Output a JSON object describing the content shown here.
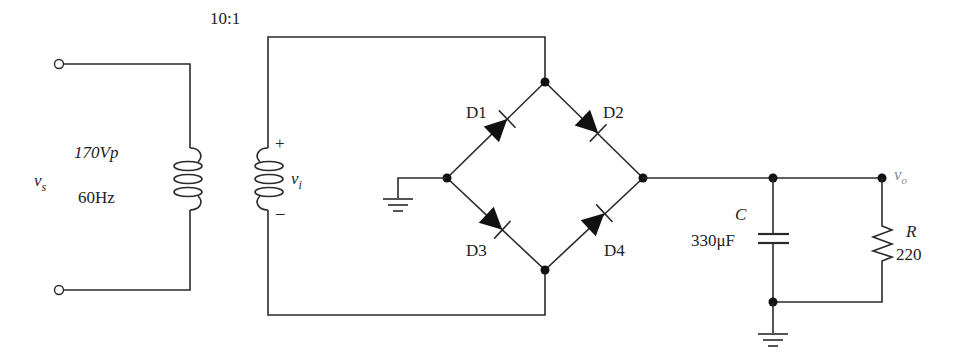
{
  "diagram": {
    "transformer": {
      "ratio_label": "10:1"
    },
    "source": {
      "symbol": "v",
      "subscript": "s",
      "amplitude": "170Vp",
      "frequency": "60Hz"
    },
    "secondary": {
      "symbol": "v",
      "subscript": "i",
      "plus": "+",
      "minus": "–"
    },
    "diodes": [
      {
        "id": "D1",
        "label": "D1"
      },
      {
        "id": "D2",
        "label": "D2"
      },
      {
        "id": "D3",
        "label": "D3"
      },
      {
        "id": "D4",
        "label": "D4"
      }
    ],
    "capacitor": {
      "name": "C",
      "value": "330μF"
    },
    "resistor": {
      "name": "R",
      "value": "220"
    },
    "output": {
      "symbol": "v",
      "subscript": "o"
    }
  }
}
